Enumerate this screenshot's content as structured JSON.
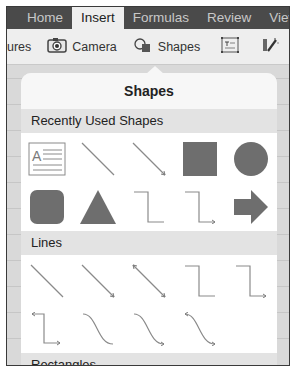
{
  "tabs": [
    {
      "label": "Home",
      "active": false
    },
    {
      "label": "Insert",
      "active": true
    },
    {
      "label": "Formulas",
      "active": false
    },
    {
      "label": "Review",
      "active": false
    },
    {
      "label": "View",
      "active": false
    }
  ],
  "toolbar": {
    "pictures_label": "ures",
    "camera_label": "Camera",
    "shapes_label": "Shapes",
    "textbox_icon": "text-box-icon",
    "magic_icon": "magic-wand-icon"
  },
  "popover": {
    "title": "Shapes",
    "sections": [
      {
        "label": "Recently Used Shapes",
        "shapes": [
          "text-box",
          "line",
          "arrow-line",
          "square",
          "circle",
          "rounded-square",
          "triangle",
          "elbow-connector",
          "elbow-arrow-connector",
          "right-arrow"
        ]
      },
      {
        "label": "Lines",
        "shapes": [
          "line",
          "arrow-line",
          "double-arrow-line",
          "elbow-connector",
          "elbow-arrow-connector",
          "elbow-double-arrow-connector",
          "curved-connector",
          "curved-arrow-connector",
          "curved-double-arrow-connector"
        ]
      },
      {
        "label": "Rectangles",
        "shapes": []
      }
    ]
  },
  "colors": {
    "tabbar_bg": "#4a4a4a",
    "shape_fill": "#6e6e6e",
    "line_stroke": "#7a7a7a"
  }
}
